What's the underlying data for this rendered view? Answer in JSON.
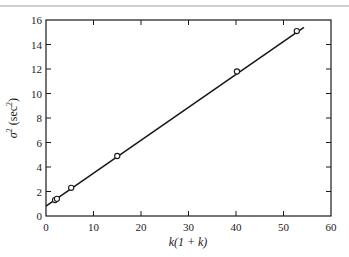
{
  "chart_data": {
    "type": "scatter",
    "title": "",
    "xlabel": "k(1 + k)",
    "ylabel": "σ² (sec²)",
    "xlim": [
      0,
      60
    ],
    "ylim": [
      0,
      16
    ],
    "x_ticks": [
      0,
      10,
      20,
      30,
      40,
      50,
      60
    ],
    "y_ticks": [
      0,
      2,
      4,
      6,
      8,
      10,
      12,
      14,
      16
    ],
    "grid": false,
    "legend": null,
    "series": [
      {
        "name": "measured",
        "marker": "open-circle",
        "points": [
          {
            "x": 1.9,
            "y": 1.3
          },
          {
            "x": 2.3,
            "y": 1.4
          },
          {
            "x": 5.3,
            "y": 2.3
          },
          {
            "x": 15.0,
            "y": 4.9
          },
          {
            "x": 40.2,
            "y": 11.8
          },
          {
            "x": 52.8,
            "y": 15.1
          }
        ]
      },
      {
        "name": "fit-line",
        "type": "line",
        "points": [
          {
            "x": 0,
            "y": 0.8
          },
          {
            "x": 54.3,
            "y": 15.4
          }
        ]
      }
    ]
  },
  "labels": {
    "x_axis": "k(1 + k)",
    "y_axis_symbol": "σ",
    "y_axis_unit": "(sec",
    "sup": "2",
    "close_paren": ")"
  },
  "style": {
    "ink": "#1a1a1a",
    "rule": "#9a9a9a",
    "background": "#ffffff"
  }
}
